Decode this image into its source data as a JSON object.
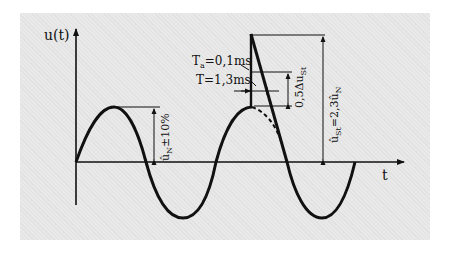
{
  "diagram": {
    "y_axis_label": "u(t)",
    "x_axis_label": "t",
    "annotations": {
      "rise_time": "Tₐ=0,1ms",
      "rise_time_main": "T",
      "rise_time_sub": "a",
      "rise_time_value": "=0,1ms",
      "half_time": "T=1,3ms",
      "half_amplitude": "0,5Δuₛt",
      "half_amplitude_main": "0,5Δu",
      "half_amplitude_sub": "St",
      "surge_peak_main": "û",
      "surge_peak_text": "=2,3û",
      "surge_peak_sub1": "St",
      "surge_peak_sub2": "N",
      "surge_peak": "ûₛt=2,3ûₙ",
      "nominal_peak": "ûₙ±10%",
      "nominal_peak_main": "û",
      "nominal_peak_sub": "N",
      "nominal_peak_text": "±10%"
    },
    "colors": {
      "background": "#e9e9e9",
      "stroke": "#111111"
    }
  }
}
